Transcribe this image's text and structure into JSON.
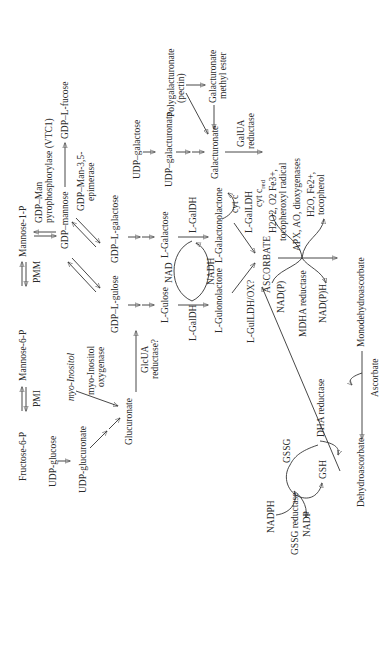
{
  "diagram": {
    "orientation": "rotated 90 degrees counter-clockwise",
    "nodes": {
      "fructose_6p": "Fructose-6-P",
      "mannose_6p": "Mannose-6-P",
      "mannose_1p": "Mannose-1-P",
      "gdp_mannose": "GDP–mannose",
      "gdp_l_fucose": "GDP–L-fucose",
      "gdp_l_gulose": "GDP–L-gulose",
      "gdp_l_galactose": "GDP–L-galactose",
      "l_gulose": "L-Gulose",
      "l_galactose": "L-Galactose",
      "l_gulonolactone": "L-Gulonolactone",
      "l_galactonolactone": "L-Galactonolactone",
      "ascorbate_caps": "ASCORBATE",
      "udp_glucose": "UDP-glucose",
      "udp_glucuronate": "UDP-glucuronate",
      "myo_inositol": "myo-Inositol",
      "glucuronate": "Glucuronate",
      "udp_galactose": "UDP–galactose",
      "udp_galacturonate": "UDP–galacturonate",
      "galacturonate": "Galacturonate",
      "polygalacturonate": "Polygalacturonate",
      "pectin": "(pectin)",
      "galacturonate_methyl_ester_1": "Galacturonate",
      "galacturonate_methyl_ester_2": "methyl ester",
      "monodehydroascorbate": "Monodehydroascorbate",
      "dehydroascorbate": "Dehydroascorbate",
      "ascorbate_small": "Ascorbate",
      "gssg": "GSSG",
      "gsh": "GSH",
      "nadph": "NADPH",
      "nadp": "NADP",
      "nadp_p_ox": "NAD(P)",
      "nadp_p_red": "NAD(P)H",
      "nad": "NAD",
      "nadh": "NADH",
      "cyt_c": "cyt c",
      "cyt_c_red": "cyt c",
      "cyt_c_red_sub": "red",
      "oxidants_1": "H2O2, O2 Fe3+,",
      "oxidants_2": "tocopheroxyl radical",
      "products_1": "H2O, Fe2+,",
      "products_2": "tocopherol"
    },
    "enzymes": {
      "pmi": "PMI",
      "pmm": "PMM",
      "gdp_man_pyro_1": "GDP–Man",
      "gdp_man_pyro_2": "pyrophosphorylase (VTC1)",
      "epimerase_1": "GDP–Man-3,5-",
      "epimerase_2": "epimerase",
      "l_galdh_left": "L-GalDH",
      "l_galdh_right": "L-GalDH",
      "l_galldh": "L-GalLDH",
      "l_gulldh": "L-GulLDH/OX?",
      "myo_inositol_oxygenase_1": "myo-Inositol",
      "myo_inositol_oxygenase_2": "oxygenase",
      "glcua_reductase_1": "GlcUA",
      "glcua_reductase_2": "reductase?",
      "galua_reductase_1": "GalUA",
      "galua_reductase_2": "reductase",
      "apx": "APX, AO, dioxygenases",
      "mdha_reductase": "MDHA reductase",
      "dha_reductase": "DHA reductase",
      "gssg_reductase": "GSSG reductase"
    }
  }
}
